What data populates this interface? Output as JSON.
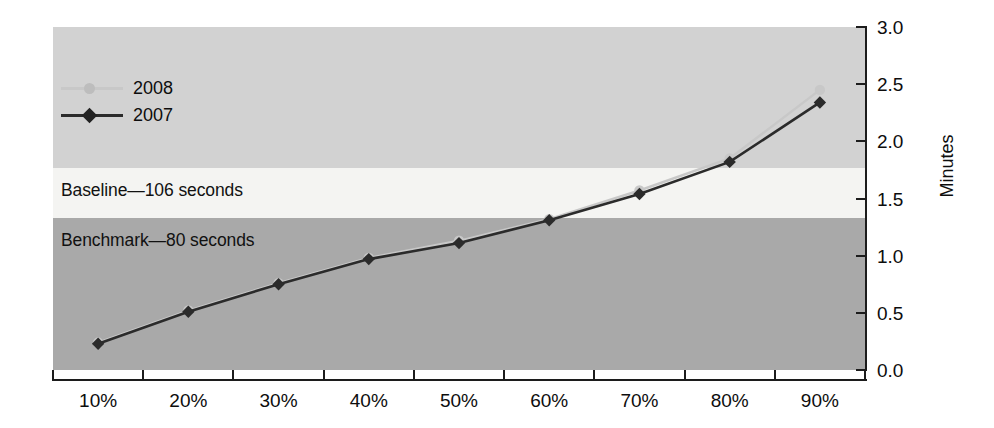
{
  "chart_data": {
    "type": "line",
    "title": "",
    "subtitle": "",
    "xlabel": "",
    "ylabel": "Minutes",
    "categories": [
      "10%",
      "20%",
      "30%",
      "40%",
      "50%",
      "60%",
      "70%",
      "80%",
      "90%"
    ],
    "series": [
      {
        "name": "2008",
        "color": "#c8c8c8",
        "marker": "circle",
        "values": [
          0.24,
          0.52,
          0.76,
          0.98,
          1.13,
          1.32,
          1.57,
          1.85,
          2.45
        ]
      },
      {
        "name": "2007",
        "color": "#2b2b2b",
        "marker": "diamond",
        "values": [
          0.23,
          0.51,
          0.75,
          0.97,
          1.11,
          1.31,
          1.54,
          1.82,
          2.34
        ]
      }
    ],
    "ylim": [
      0.0,
      3.0
    ],
    "y_ticks": [
      "0.0",
      "0.5",
      "1.0",
      "1.5",
      "2.0",
      "2.5",
      "3.0"
    ],
    "y_tick_values": [
      0.0,
      0.5,
      1.0,
      1.5,
      2.0,
      2.5,
      3.0
    ],
    "grid": false,
    "legend_position": "upper-left",
    "bands": [
      {
        "name": "baseline",
        "label": "Baseline—106 seconds",
        "from": 1.333,
        "to": 1.767,
        "color": "#f4f4f2",
        "seconds": 106
      },
      {
        "name": "benchmark",
        "label": "Benchmark—80 seconds",
        "from": 0.0,
        "to": 1.333,
        "color": "#a9a9a9",
        "seconds": 80
      },
      {
        "name": "above-baseline",
        "label": "",
        "from": 1.767,
        "to": 3.0,
        "color": "#d2d2d2",
        "seconds": null
      }
    ],
    "annotations": [
      "Baseline—106 seconds",
      "Benchmark—80 seconds"
    ]
  },
  "legend": {
    "items": [
      {
        "label": "2008"
      },
      {
        "label": "2007"
      }
    ]
  },
  "axes": {
    "y_title": "Minutes",
    "y_tick_labels": [
      "3.0",
      "2.5",
      "2.0",
      "1.5",
      "1.0",
      "0.5",
      "0.0"
    ],
    "x_tick_labels": [
      "10%",
      "20%",
      "30%",
      "40%",
      "50%",
      "60%",
      "70%",
      "80%",
      "90%"
    ]
  },
  "bands_text": {
    "baseline": "Baseline—106 seconds",
    "benchmark": "Benchmark—80 seconds"
  },
  "colors": {
    "band_top": "#d2d2d2",
    "band_middle": "#f4f4f2",
    "band_bottom": "#a9a9a9",
    "series_2008": "#c8c8c8",
    "series_2007": "#2b2b2b",
    "axis": "#1c1c1c"
  }
}
